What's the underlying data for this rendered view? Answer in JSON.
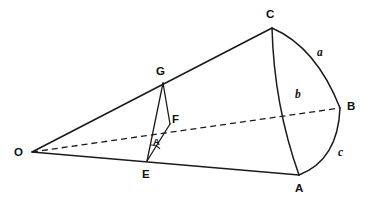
{
  "diagram": {
    "kind": "spherical-triangle-cone-diagram",
    "background_color": "#ffffff",
    "stroke_color": "#1b1b1b",
    "vertex_labels": [
      {
        "name": "O",
        "text": "O",
        "x": 14,
        "y": 147
      },
      {
        "name": "C",
        "text": "C",
        "x": 266,
        "y": 9
      },
      {
        "name": "B",
        "text": "B",
        "x": 347,
        "y": 101
      },
      {
        "name": "A",
        "text": "A",
        "x": 295,
        "y": 183
      },
      {
        "name": "G",
        "text": "G",
        "x": 156,
        "y": 66
      },
      {
        "name": "F",
        "text": "F",
        "x": 172,
        "y": 114
      },
      {
        "name": "E",
        "text": "E",
        "x": 142,
        "y": 169
      }
    ],
    "side_labels": [
      {
        "name": "a",
        "text": "a",
        "x": 317,
        "y": 47
      },
      {
        "name": "b",
        "text": "b",
        "x": 295,
        "y": 89
      },
      {
        "name": "c",
        "text": "c",
        "x": 338,
        "y": 147
      }
    ],
    "angle_labels": [
      {
        "name": "A",
        "text": "A",
        "x": 153,
        "y": 137
      }
    ],
    "points": {
      "O": {
        "x": 32,
        "y": 152
      },
      "C": {
        "x": 272,
        "y": 28
      },
      "B": {
        "x": 340,
        "y": 108
      },
      "A": {
        "x": 299,
        "y": 175
      },
      "G": {
        "x": 163,
        "y": 83
      },
      "F": {
        "x": 170,
        "y": 124
      },
      "E": {
        "x": 147,
        "y": 161
      }
    },
    "segments": [
      {
        "name": "O-to-C",
        "from": "O",
        "to": "C",
        "style": "solid"
      },
      {
        "name": "O-to-A",
        "from": "O",
        "to": "A",
        "style": "solid"
      },
      {
        "name": "O-to-B",
        "from": "O",
        "to": "B",
        "style": "dashed"
      },
      {
        "name": "G-to-F",
        "from": "G",
        "to": "F",
        "style": "solid"
      },
      {
        "name": "G-to-E",
        "from": "G",
        "to": "E",
        "style": "solid"
      },
      {
        "name": "E-to-F",
        "from": "E",
        "to": "F",
        "style": "solid"
      }
    ],
    "arcs": [
      {
        "name": "arc-a-C-to-B",
        "label": "a",
        "from": "C",
        "to": "B"
      },
      {
        "name": "arc-b-C-to-A",
        "label": "b",
        "from": "C",
        "to": "A"
      },
      {
        "name": "arc-c-B-to-A",
        "label": "c",
        "from": "B",
        "to": "A"
      }
    ]
  }
}
